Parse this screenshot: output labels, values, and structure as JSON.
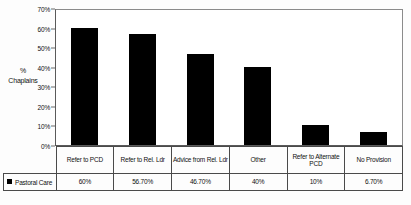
{
  "chart_data": {
    "type": "bar",
    "title": "",
    "xlabel": "",
    "ylabel": "% Chaplains",
    "ylim": [
      0,
      70
    ],
    "ytick_labels": [
      "70%",
      "60%",
      "50%",
      "40%",
      "30%",
      "20%",
      "10%",
      "0%"
    ],
    "ytick_values": [
      70,
      60,
      50,
      40,
      30,
      20,
      10,
      0
    ],
    "grid": false,
    "legend_position": "bottom-left",
    "categories": [
      "Refer to PCD",
      "Refer to Rel. Ldr",
      "Advice from Rel. Ldr",
      "Other",
      "Refer to Alternate PCD",
      "No Provision"
    ],
    "values": [
      60,
      56.7,
      46.7,
      40,
      10,
      6.7
    ],
    "value_labels": [
      "60%",
      "56.70%",
      "46.70%",
      "40%",
      "10%",
      "6.70%"
    ],
    "series": [
      {
        "name": "Pastoral Care",
        "color": "#000000",
        "values": [
          60,
          56.7,
          46.7,
          40,
          10,
          6.7
        ]
      }
    ]
  },
  "axis": {
    "y_title_line1": "%",
    "y_title_line2": "Chaplains"
  },
  "legend": {
    "series_label": "Pastoral Care",
    "swatch_color": "#000000"
  }
}
